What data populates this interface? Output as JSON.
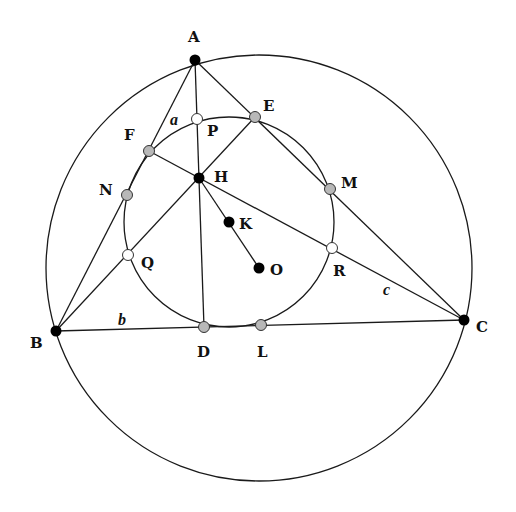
{
  "diagram": {
    "colors": {
      "stroke": "#1a1a1a",
      "vertex": "#000000",
      "midpoint": "#b8b8b8",
      "euler": "#ffffff"
    },
    "circumcircle": {
      "cx": 259,
      "cy": 268,
      "r": 213
    },
    "nine_point_circle": {
      "cx": 229,
      "cy": 222,
      "r": 105
    },
    "points": {
      "A": {
        "label": "A",
        "x": 195,
        "y": 60,
        "type": "vertex",
        "lx": 188,
        "ly": 42
      },
      "B": {
        "label": "B",
        "x": 56,
        "y": 331,
        "type": "vertex",
        "lx": 30,
        "ly": 348
      },
      "C": {
        "label": "C",
        "x": 464,
        "y": 320,
        "type": "vertex",
        "lx": 476,
        "ly": 332
      },
      "H": {
        "label": "H",
        "x": 199,
        "y": 178,
        "type": "vertex",
        "lx": 214,
        "ly": 182
      },
      "K": {
        "label": "K",
        "x": 229,
        "y": 222,
        "type": "vertex",
        "lx": 239,
        "ly": 229
      },
      "O": {
        "label": "O",
        "x": 259,
        "y": 268,
        "type": "vertex",
        "lx": 270,
        "ly": 275
      },
      "D": {
        "label": "D",
        "x": 204,
        "y": 327,
        "type": "midpoint",
        "lx": 197,
        "ly": 357
      },
      "E": {
        "label": "E",
        "x": 255,
        "y": 117,
        "type": "midpoint",
        "lx": 263,
        "ly": 111
      },
      "F": {
        "label": "F",
        "x": 149,
        "y": 151,
        "type": "midpoint",
        "lx": 124,
        "ly": 140
      },
      "L": {
        "label": "L",
        "x": 261,
        "y": 325,
        "type": "midpoint",
        "lx": 257,
        "ly": 357
      },
      "M": {
        "label": "M",
        "x": 330,
        "y": 189,
        "type": "midpoint",
        "lx": 341,
        "ly": 188
      },
      "N": {
        "label": "N",
        "x": 127,
        "y": 195,
        "type": "midpoint",
        "lx": 99,
        "ly": 195
      },
      "P": {
        "label": "P",
        "x": 197,
        "y": 119,
        "type": "euler",
        "lx": 207,
        "ly": 136
      },
      "Q": {
        "label": "Q",
        "x": 128,
        "y": 255,
        "type": "euler",
        "lx": 141,
        "ly": 268
      },
      "R": {
        "label": "R",
        "x": 332,
        "y": 248,
        "type": "euler",
        "lx": 333,
        "ly": 276
      }
    },
    "side_labels": {
      "a": {
        "label": "a",
        "x": 170,
        "y": 125
      },
      "b": {
        "label": "b",
        "x": 118,
        "y": 325
      },
      "c": {
        "label": "c",
        "x": 383,
        "y": 295
      }
    }
  }
}
